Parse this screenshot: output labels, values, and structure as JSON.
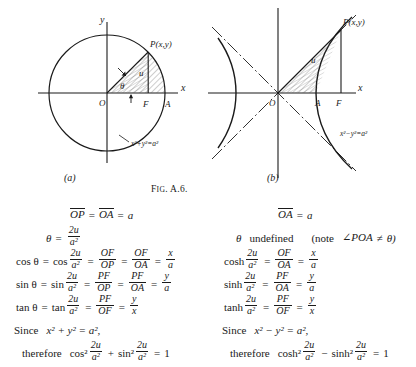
{
  "figure": {
    "caption": "FIG. A.6.",
    "caption_lead": "F",
    "caption_rest": "IG",
    "caption_tail": ". A.6.",
    "sub_captions": {
      "left": "(a)",
      "right": "(b)"
    },
    "circle": {
      "name": "circle-diagram",
      "x_axis_label": "x",
      "y_axis_label": "y",
      "origin_label": "O",
      "point_label": "P(x,y)",
      "foot_label": "F",
      "vertex_label": "A",
      "area_label": "u",
      "angle_label": "θ",
      "curve_equation": "x²+y²=a²"
    },
    "hyperbola": {
      "name": "hyperbola-diagram",
      "x_axis_label": "x",
      "origin_label": "O",
      "point_label": "P(x,y)",
      "foot_label": "F",
      "vertex_label": "A",
      "area_label": "u",
      "curve_equation": "x²−y²=a²"
    }
  },
  "left_column": {
    "name": "circular-functions-derivation",
    "l1": {
      "seg1": "OP",
      "eq1": "=",
      "seg2": "OA",
      "eq2": "=",
      "val": "a"
    },
    "l2": {
      "theta": "θ",
      "eq": "=",
      "num": "2u",
      "den": "a²"
    },
    "l3": {
      "fn_theta": "cos θ",
      "eq1": "=",
      "fn": "cos",
      "num": "2u",
      "den": "a²",
      "eq2": "=",
      "f1n": "OF",
      "f1d": "OP",
      "eq3": "=",
      "f2n": "OF",
      "f2d": "OA",
      "eq4": "=",
      "f3n": "x",
      "f3d": "a"
    },
    "l4": {
      "fn_theta": "sin θ",
      "eq1": "=",
      "fn": "sin",
      "num": "2u",
      "den": "a²",
      "eq2": "=",
      "f1n": "PF",
      "f1d": "OP",
      "eq3": "=",
      "f2n": "PF",
      "f2d": "OA",
      "eq4": "=",
      "f3n": "y",
      "f3d": "a"
    },
    "l5": {
      "fn_theta": "tan θ",
      "eq1": "=",
      "fn": "tan",
      "num": "2u",
      "den": "a²",
      "eq2": "=",
      "f1n": "PF",
      "f1d": "OF",
      "eq3": "=",
      "f2n": "y",
      "f2d": "x"
    },
    "l6": {
      "since": "Since",
      "expr": "x² + y² = a²,"
    },
    "l7": {
      "therefore": "therefore",
      "fn1": "cos²",
      "num1": "2u",
      "den1": "a²",
      "plus": "+",
      "fn2": "sin²",
      "num2": "2u",
      "den2": "a²",
      "eq": "=",
      "one": "1"
    }
  },
  "right_column": {
    "name": "hyperbolic-functions-derivation",
    "l1": {
      "seg": "OA",
      "eq": "=",
      "val": "a"
    },
    "l2": {
      "theta": "θ",
      "word": "undefined",
      "note": "(note",
      "angle": "∠POA",
      "neq": "≠",
      "theta2": "θ)"
    },
    "l3": {
      "fn": "cosh",
      "num": "2u",
      "den": "a²",
      "eq1": "=",
      "f1n": "OF",
      "f1d": "OA",
      "eq2": "=",
      "f2n": "x",
      "f2d": "a"
    },
    "l4": {
      "fn": "sinh",
      "num": "2u",
      "den": "a²",
      "eq1": "=",
      "f1n": "PF",
      "f1d": "OA",
      "eq2": "=",
      "f2n": "y",
      "f2d": "a"
    },
    "l5": {
      "fn": "tanh",
      "num": "2u",
      "den": "a²",
      "eq1": "=",
      "f1n": "PF",
      "f1d": "OF",
      "eq2": "=",
      "f2n": "y",
      "f2d": "x"
    },
    "l6": {
      "since": "Since",
      "expr": "x² − y² = a²,"
    },
    "l7": {
      "therefore": "therefore",
      "fn1": "cosh²",
      "num1": "2u",
      "den1": "a²",
      "minus": "−",
      "fn2": "sinh²",
      "num2": "2u",
      "den2": "a²",
      "eq": "=",
      "one": "1"
    }
  },
  "colors": {
    "ink": "#1a1a1a",
    "paper": "#ffffff",
    "hatch": "#555555"
  }
}
